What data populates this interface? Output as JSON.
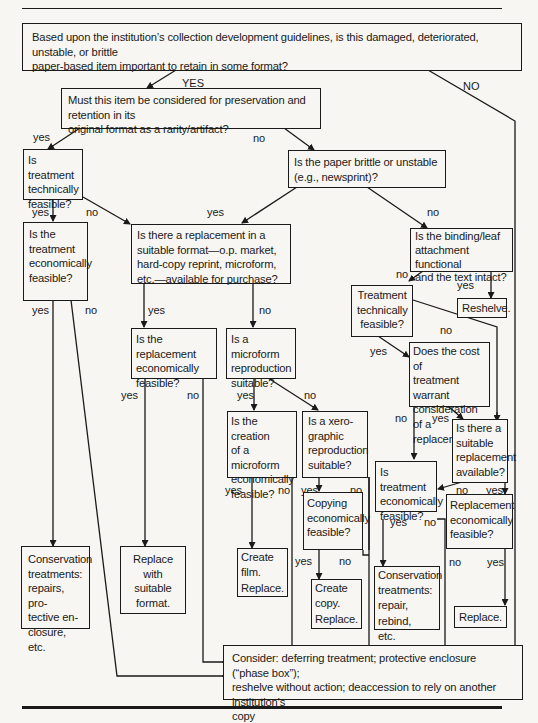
{
  "flowchart": {
    "nodes": {
      "q_important": "Based upon the institution’s collection development guidelines, is this damaged, deteriorated, unstable, or brittle\npaper-based item important to retain in some format?",
      "q_original_format": "Must this item be considered for preservation and retention in its\noriginal format as a rarity/artifact?",
      "q_treatment_tech": "Is treatment\ntechnically\nfeasible?",
      "q_paper_brittle": "Is the paper brittle or unstable\n(e.g., newsprint)?",
      "q_treatment_econ": "Is the\ntreatment\neconomically\nfeasible?",
      "q_replacement_available": "Is there a replacement in a\nsuitable format—o.p. market,\nhard-copy reprint, microform,\netc.—available for purchase?",
      "q_binding_functional": "Is the binding/leaf\nattachment functional\nand the text intact?",
      "a_reshelve": "Reshelve.",
      "q_treatment_tech_2": "Treatment\ntechnically\nfeasible?",
      "q_replacement_econ": "Is the replacement\neconomically\nfeasible?",
      "q_microform_suitable": "Is a microform\nreproduction\nsuitable?",
      "q_cost_warrant": "Does the cost of\ntreatment warrant\nconsideration\nof a replacement?",
      "q_suitable_replacement": "Is there a\nsuitable\nreplacement\navailable?",
      "q_microform_econ": "Is the creation\nof a microform\neconomically\nfeasible?",
      "q_xerographic": "Is a xero-\ngraphic\nreproduction\nsuitable?",
      "q_treatment_econ_2": "Is treatment\neconomically\nfeasible?",
      "q_replacement_econ_2": "Replacement\neconomically\nfeasible?",
      "q_copying_econ": "Copying\neconomically\nfeasible?",
      "a_conservation_1": "Conservation\ntreatments:\nrepairs, pro-\ntective en-\nclosure, etc.",
      "a_replace_format": "Replace\nwith\nsuitable\nformat.",
      "a_create_film": "Create\nfilm.\nReplace.",
      "a_create_copy": "Create\ncopy.\nReplace.",
      "a_conservation_2": "Conservation\ntreatments:\nrepair, rebind,\netc.",
      "a_replace": "Replace.",
      "a_consider": "Consider: deferring treatment; protective enclosure (“phase box”);\nreshelve without action; deaccession to rely on another institution’s\ncopy"
    },
    "edge_labels": {
      "top_yes": "YES",
      "top_no": "NO",
      "orig_yes": "yes",
      "orig_no": "no",
      "tech_yes": "yes",
      "tech_no": "no",
      "brittle_yes": "yes",
      "brittle_no": "no",
      "econ_yes": "yes",
      "econ_no": "no",
      "repl_yes": "yes",
      "repl_no": "no",
      "binding_no": "no",
      "binding_yes": "yes",
      "tech2_yes": "yes",
      "tech2_no": "no",
      "replecon_yes": "yes",
      "replecon_no": "no",
      "micro_yes": "yes",
      "micro_no": "no",
      "cost_no": "no",
      "cost_yes": "yes",
      "microecon_yes": "yes",
      "microecon_no": "no",
      "xero_yes": "yes",
      "xero_no": "no",
      "suitrepl_no": "no",
      "suitrepl_yes": "yes",
      "copy_yes": "yes",
      "copy_no": "no",
      "treat2_yes": "yes",
      "treat2_no": "no",
      "replecon2_no": "no",
      "replecon2_yes": "yes"
    }
  }
}
